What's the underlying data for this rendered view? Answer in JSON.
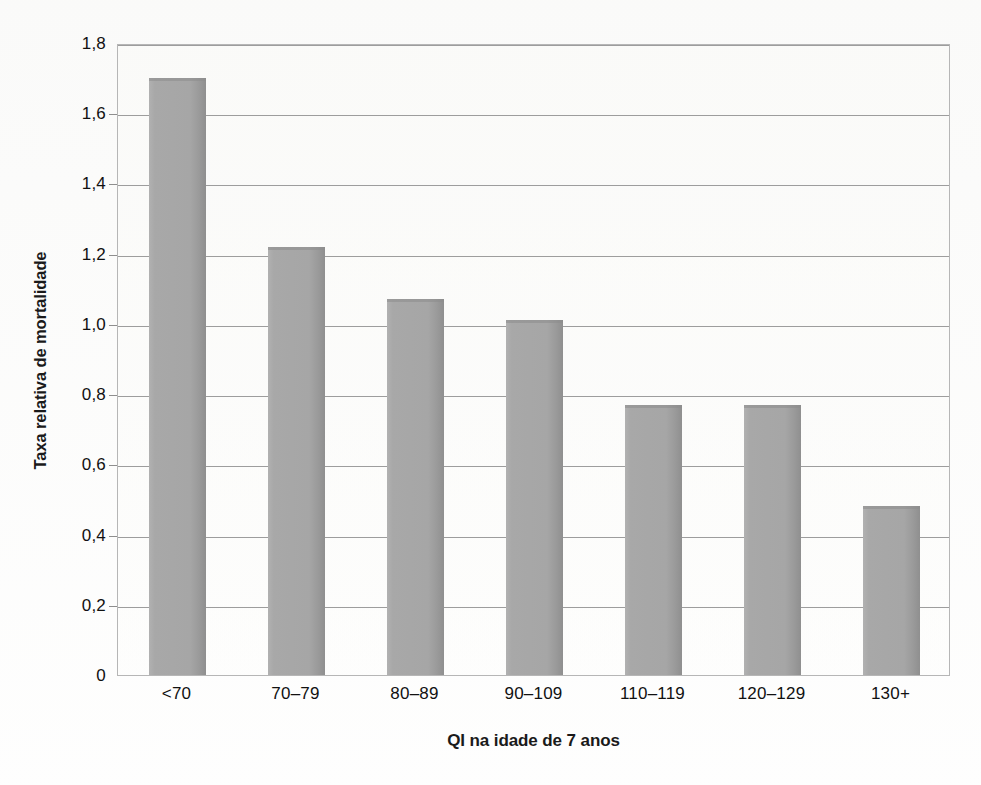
{
  "chart_data": {
    "type": "bar",
    "title": "",
    "subtitle": "",
    "xlabel": "QI na idade de 7 anos",
    "ylabel": "Taxa relativa de mortalidade",
    "categories": [
      "<70",
      "70–79",
      "80–89",
      "90–109",
      "110–119",
      "120–129",
      "130+"
    ],
    "values": [
      1.7,
      1.22,
      1.07,
      1.01,
      0.77,
      0.77,
      0.48
    ],
    "ylim": [
      0,
      1.8
    ],
    "xlim": [
      0,
      7
    ],
    "y_ticks": [
      0,
      0.2,
      0.4,
      0.6,
      0.8,
      1.0,
      1.2,
      1.4,
      1.6,
      1.8
    ],
    "y_tick_labels": [
      "0",
      "0,2",
      "0,4",
      "0,6",
      "0,8",
      "1,0",
      "1,2",
      "1,4",
      "1,6",
      "1,8"
    ],
    "grid": true,
    "grid_axis": "y",
    "legend": false,
    "legend_position": "none",
    "decimal_separator": ",",
    "series": [
      {
        "name": "Taxa relativa de mortalidade",
        "values": [
          1.7,
          1.22,
          1.07,
          1.01,
          0.77,
          0.77,
          0.48
        ]
      }
    ],
    "colors": {
      "bar_fill": "#a6a6a6",
      "bar_edge": "#8f8f8f",
      "gridline": "#9d9d9d",
      "plot_border": "#b6b6b6",
      "background": "#fbfbfa",
      "text": "#111111"
    }
  }
}
